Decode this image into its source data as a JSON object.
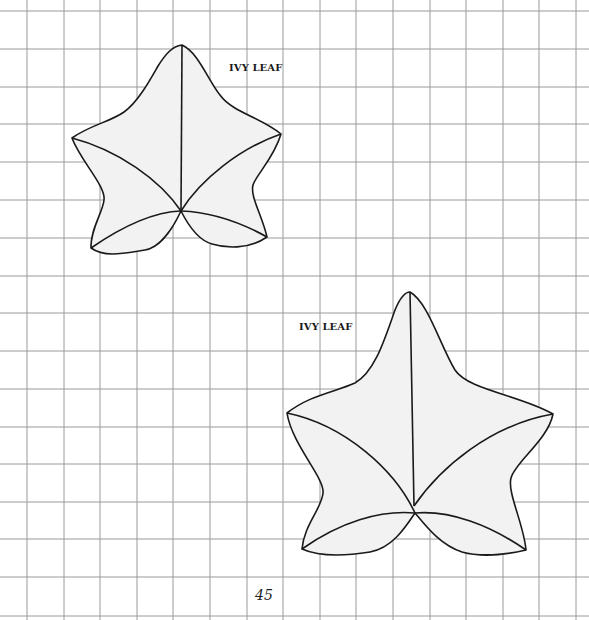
{
  "page": {
    "background": "#ffffff",
    "grid_color": "#9a9a9a",
    "leaf_fill": "#f2f2f2",
    "leaf_stroke": "#1a1a1a",
    "page_number": "45"
  },
  "templates": [
    {
      "id": "ivy-leaf-small",
      "label": "IVY LEAF"
    },
    {
      "id": "ivy-leaf-large",
      "label": "IVY LEAF"
    }
  ]
}
